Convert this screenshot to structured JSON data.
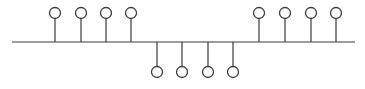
{
  "diagram": {
    "type": "bus-topology",
    "canvas": {
      "width": 365,
      "height": 89
    },
    "colors": {
      "stroke": "#3a3a3a",
      "background": "#ffffff",
      "node_fill": "#ffffff"
    },
    "bus": {
      "x1": 12,
      "x2": 355,
      "y": 42
    },
    "node_radius": 5.5,
    "nodes": [
      {
        "id": "top-1",
        "side": "top",
        "x": 55,
        "cy": 13
      },
      {
        "id": "top-2",
        "side": "top",
        "x": 81,
        "cy": 13
      },
      {
        "id": "top-3",
        "side": "top",
        "x": 106,
        "cy": 13
      },
      {
        "id": "top-4",
        "side": "top",
        "x": 131,
        "cy": 13
      },
      {
        "id": "bottom-1",
        "side": "bottom",
        "x": 157,
        "cy": 72
      },
      {
        "id": "bottom-2",
        "side": "bottom",
        "x": 182,
        "cy": 72
      },
      {
        "id": "bottom-3",
        "side": "bottom",
        "x": 208,
        "cy": 72
      },
      {
        "id": "bottom-4",
        "side": "bottom",
        "x": 233,
        "cy": 72
      },
      {
        "id": "top-5",
        "side": "top",
        "x": 259,
        "cy": 13
      },
      {
        "id": "top-6",
        "side": "top",
        "x": 285,
        "cy": 13
      },
      {
        "id": "top-7",
        "side": "top",
        "x": 311,
        "cy": 13
      },
      {
        "id": "top-8",
        "side": "top",
        "x": 336,
        "cy": 13
      }
    ]
  }
}
